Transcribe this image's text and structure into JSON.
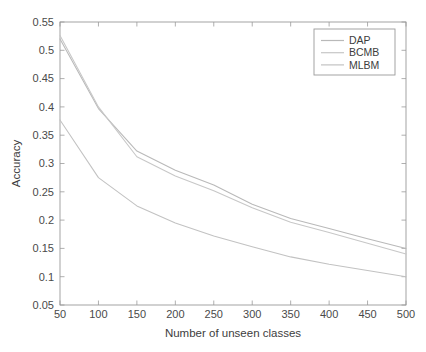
{
  "figure": {
    "background": "#ffffff",
    "axis_color": "#9a9a9a",
    "text_color": "#3d3d3d"
  },
  "chart_data": {
    "type": "line",
    "title": "",
    "xlabel": "Number of unseen classes",
    "ylabel": "Accuracy",
    "x": [
      50,
      100,
      150,
      200,
      250,
      300,
      350,
      400,
      450,
      500
    ],
    "xlim": [
      50,
      500
    ],
    "ylim": [
      0.05,
      0.55
    ],
    "xticks": [
      50,
      100,
      150,
      200,
      250,
      300,
      350,
      400,
      450,
      500
    ],
    "xtick_labels": [
      "50",
      "100",
      "150",
      "200",
      "250",
      "300",
      "350",
      "400",
      "450",
      "500"
    ],
    "yticks": [
      0.05,
      0.1,
      0.15,
      0.2,
      0.25,
      0.3,
      0.35,
      0.4,
      0.45,
      0.5,
      0.55
    ],
    "ytick_labels": [
      "0.05",
      "0.1",
      "0.15",
      "0.2",
      "0.25",
      "0.3",
      "0.35",
      "0.4",
      "0.45",
      "0.5",
      "0.55"
    ],
    "grid": false,
    "legend_position": "upper right",
    "series": [
      {
        "name": "DAP",
        "color": "#b9b9b9",
        "values": [
          0.52,
          0.397,
          0.322,
          0.288,
          0.262,
          0.228,
          0.203,
          0.185,
          0.167,
          0.15
        ]
      },
      {
        "name": "BCMB",
        "color": "#c7c7c7",
        "values": [
          0.526,
          0.4,
          0.312,
          0.278,
          0.252,
          0.222,
          0.196,
          0.178,
          0.159,
          0.14
        ]
      },
      {
        "name": "MLBM",
        "color": "#c2c2c2",
        "values": [
          0.377,
          0.275,
          0.225,
          0.195,
          0.172,
          0.153,
          0.135,
          0.122,
          0.111,
          0.1
        ]
      }
    ]
  },
  "legend": {
    "items": [
      {
        "label": "DAP"
      },
      {
        "label": "BCMB"
      },
      {
        "label": "MLBM"
      }
    ]
  }
}
